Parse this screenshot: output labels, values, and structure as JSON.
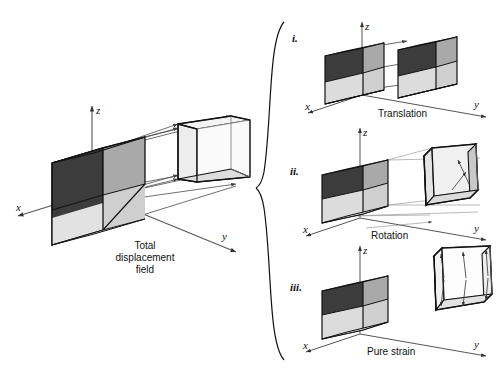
{
  "figure": {
    "title_caption": "Total displacement field",
    "background": "#ffffff"
  },
  "colors": {
    "face_dark": "#3c3c3c",
    "face_mid": "#a9a9a9",
    "face_light": "#d6d6d6",
    "face_white": "#ffffff",
    "ghost_fill": "#ededed",
    "outline": "#111111",
    "thin_line": "#555555",
    "arrow": "#444444"
  },
  "main_panel": {
    "name": "total-displacement-field",
    "caption_lines": [
      "Total",
      "displacement",
      "field"
    ],
    "axes": {
      "x_label": "x",
      "y_label": "y",
      "z_label": "z"
    },
    "undeformed_cube_label": "reference-cube",
    "deformed_cube_label": "displaced-cube"
  },
  "brace": {
    "name": "decomposition-brace",
    "orientation": "left-pointing"
  },
  "sub_panels": [
    {
      "numeral": "i.",
      "caption": "Translation",
      "name": "panel-translation",
      "axes": {
        "x_label": "x",
        "y_label": "y",
        "z_label": "z"
      }
    },
    {
      "numeral": "ii.",
      "caption": "Rotation",
      "name": "panel-rotation",
      "axes": {
        "x_label": "x",
        "y_label": "y",
        "z_label": "z"
      }
    },
    {
      "numeral": "iii.",
      "caption": "Pure strain",
      "name": "panel-pure-strain",
      "axes": {
        "x_label": "x",
        "y_label": "y",
        "z_label": "z"
      }
    }
  ]
}
